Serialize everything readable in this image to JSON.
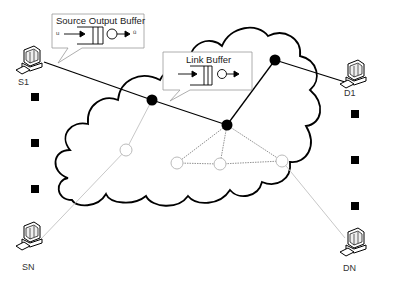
{
  "callouts": {
    "source_output_buffer": {
      "title": "Source Output Buffer",
      "input_symbol": "u",
      "output_symbol": "ū"
    },
    "link_buffer": {
      "title": "Link Buffer"
    }
  },
  "hosts": {
    "s1": {
      "label": "S1"
    },
    "sn": {
      "label": "SN"
    },
    "d1": {
      "label": "D1"
    },
    "dn": {
      "label": "DN"
    }
  },
  "nodes": {
    "active": [
      {
        "id": "n1",
        "x": 152,
        "y": 100
      },
      {
        "id": "n2",
        "x": 227,
        "y": 125
      },
      {
        "id": "n3",
        "x": 275,
        "y": 60
      }
    ],
    "inactive": [
      {
        "id": "m1",
        "x": 126,
        "y": 150
      },
      {
        "id": "m2",
        "x": 177,
        "y": 163
      },
      {
        "id": "m3",
        "x": 220,
        "y": 164
      },
      {
        "id": "m4",
        "x": 282,
        "y": 161
      }
    ]
  },
  "ellipsis_markers": {
    "left": [
      97,
      143,
      189
    ],
    "right": [
      114,
      160,
      206
    ]
  },
  "colors": {
    "active_path": "#000000",
    "inactive_path": "#c8c8c8",
    "dashed_link": "#777777",
    "cloud_outline": "#000000"
  }
}
